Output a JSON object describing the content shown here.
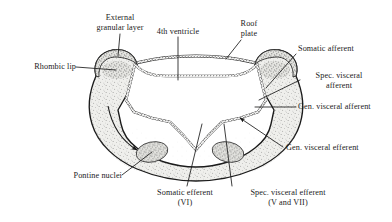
{
  "figure": {
    "background_color": "#ffffff",
    "ink_color": "#1b1b1b",
    "mantle_fill": "#ededea"
  },
  "labels": {
    "external_granular_layer": "External\ngranular layer",
    "fourth_ventricle": "4th ventricle",
    "roof_plate": "Roof\nplate",
    "somatic_afferent": "Somatic afferent",
    "spec_visceral_afferent": "Spec. visceral\nafferent",
    "gen_visceral_afferent": "Gen. visceral afferent",
    "gen_visceral_efferent": "Gen. visceral efferent",
    "spec_visceral_efferent": "Spec. visceral efferent\n(V and VII)",
    "somatic_efferent": "Somatic efferent\n(VI)",
    "pontine_nuclei": "Pontine nuclei",
    "rhombic_lip": "Rhombic lip"
  },
  "structures": [
    {
      "name": "rhombic-lip-left",
      "label_key": "rhombic_lip"
    },
    {
      "name": "external-granular-layer",
      "label_key": "external_granular_layer"
    },
    {
      "name": "fourth-ventricle-cavity",
      "label_key": "fourth_ventricle"
    },
    {
      "name": "roof-plate",
      "label_key": "roof_plate"
    },
    {
      "name": "somatic-afferent-column",
      "label_key": "somatic_afferent"
    },
    {
      "name": "special-visceral-afferent-column",
      "label_key": "spec_visceral_afferent"
    },
    {
      "name": "general-visceral-afferent-column",
      "label_key": "gen_visceral_afferent"
    },
    {
      "name": "general-visceral-efferent-column",
      "label_key": "gen_visceral_efferent"
    },
    {
      "name": "special-visceral-efferent-column",
      "label_key": "spec_visceral_efferent"
    },
    {
      "name": "somatic-efferent-column",
      "label_key": "somatic_efferent"
    },
    {
      "name": "pontine-nuclei",
      "label_key": "pontine_nuclei"
    }
  ]
}
